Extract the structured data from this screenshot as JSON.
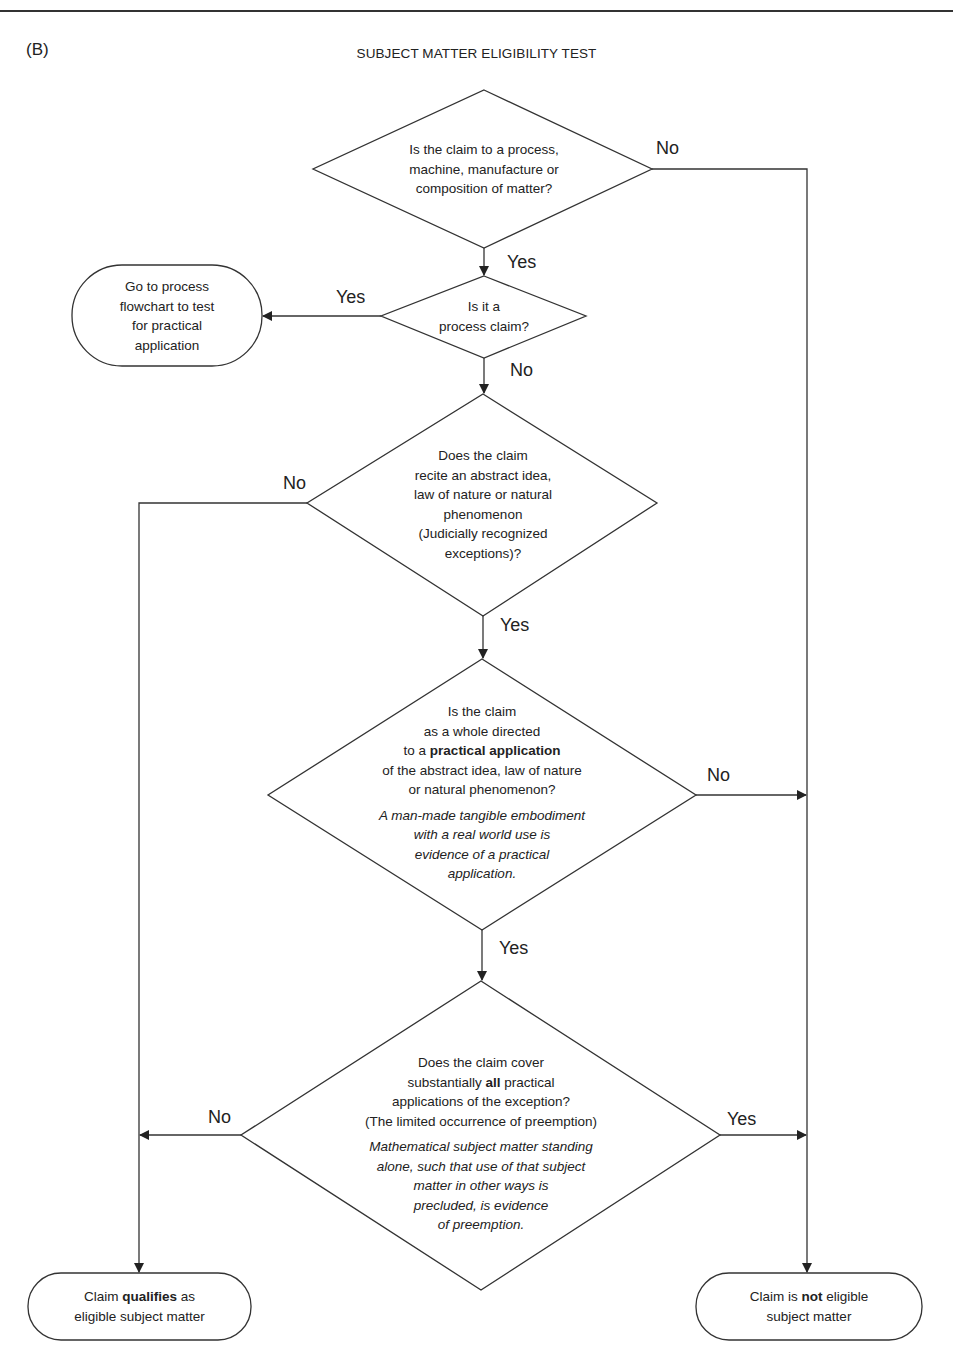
{
  "header": {
    "panel_label": "(B)",
    "title": "SUBJECT MATTER ELIGIBILITY TEST"
  },
  "nodes": {
    "q1": {
      "type": "decision",
      "lines": [
        "Is the claim to a process,",
        "machine, manufacture or",
        "composition of matter?"
      ]
    },
    "q2": {
      "type": "decision",
      "lines": [
        "Is it a",
        "process claim?"
      ]
    },
    "process_flowchart": {
      "type": "terminal",
      "lines": [
        "Go to process",
        "flowchart to test",
        "for practical",
        "application"
      ]
    },
    "q3": {
      "type": "decision",
      "lines": [
        "Does the claim",
        "recite an abstract idea,",
        "law of nature or natural",
        "phenomenon",
        "(Judicially recognized",
        "exceptions)?"
      ]
    },
    "q4": {
      "type": "decision",
      "line1": "Is the claim",
      "line2": "as a whole directed",
      "line3_pre": "to a ",
      "line3_bold": "practical application",
      "line4": "of the abstract idea, law of nature",
      "line5": "or natural phenomenon?",
      "note_lines": [
        "A man-made tangible embodiment",
        "with a real world use is",
        "evidence of a practical",
        "application."
      ]
    },
    "q5": {
      "type": "decision",
      "line1": "Does the claim cover",
      "line2_pre": "substantially ",
      "line2_bold": "all",
      "line2_post": " practical",
      "line3": "applications of the exception?",
      "line4": "(The limited occurrence of preemption)",
      "note_lines": [
        "Mathematical subject matter standing",
        "alone, such that use of that subject",
        "matter in other ways is",
        "precluded, is evidence",
        "of preemption."
      ]
    },
    "eligible": {
      "type": "terminal",
      "line1_pre": "Claim ",
      "line1_bold": "qualifies",
      "line1_post": " as",
      "line2": "eligible subject matter"
    },
    "not_eligible": {
      "type": "terminal",
      "line1_pre": "Claim is ",
      "line1_bold": "not",
      "line1_post": " eligible",
      "line2": "subject matter"
    }
  },
  "edges": {
    "q1_no": "No",
    "q1_yes": "Yes",
    "q2_yes": "Yes",
    "q2_no": "No",
    "q3_no": "No",
    "q3_yes": "Yes",
    "q4_no": "No",
    "q4_yes": "Yes",
    "q5_no": "No",
    "q5_yes": "Yes"
  },
  "colors": {
    "stroke": "#333333",
    "text": "#222222",
    "background": "#ffffff"
  }
}
